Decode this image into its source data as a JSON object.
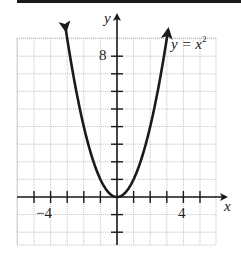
{
  "chart_data": {
    "type": "line",
    "title": "",
    "xlabel": "x",
    "ylabel": "y",
    "equation_label": "y = x",
    "equation_exponent": "2",
    "function": "y = x^2",
    "x": [
      -3,
      -2,
      -1,
      0,
      1,
      2,
      3
    ],
    "series": [
      {
        "name": "y = x^2",
        "values": [
          9,
          4,
          1,
          0,
          1,
          4,
          9
        ]
      }
    ],
    "x_tick_labels": [
      {
        "value": -4,
        "label": "−4"
      },
      {
        "value": 4,
        "label": "4"
      }
    ],
    "y_tick_labels": [
      {
        "value": 8,
        "label": "8"
      }
    ],
    "xlim": [
      -6,
      6
    ],
    "ylim": [
      -2.7,
      9.2
    ],
    "grid": true,
    "arrows_on_curve_ends": true,
    "colors": {
      "curve": "#1a1a1a",
      "grid": "#bdbdbd",
      "axes": "#1a1a1a"
    }
  }
}
